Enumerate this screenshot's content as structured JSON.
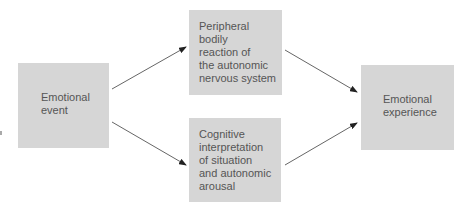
{
  "diagram": {
    "type": "flow",
    "nodes": [
      {
        "id": "event",
        "label": "Emotional event",
        "lines": [
          "Emotional",
          "event"
        ]
      },
      {
        "id": "physio",
        "label": "Peripheral bodily reaction of the autonomic nervous system",
        "lines": [
          "Peripheral",
          "bodily",
          "reaction of",
          "the autonomic",
          "nervous system"
        ]
      },
      {
        "id": "cognitive",
        "label": "Cognitive interpretation of situation and autonomic arousal",
        "lines": [
          "Cognitive",
          "interpretation",
          "of situation",
          "and autonomic",
          "arousal"
        ]
      },
      {
        "id": "experience",
        "label": "Emotional experience",
        "lines": [
          "Emotional",
          "experience"
        ]
      }
    ],
    "edges": [
      {
        "from": "event",
        "to": "physio"
      },
      {
        "from": "event",
        "to": "cognitive"
      },
      {
        "from": "physio",
        "to": "experience"
      },
      {
        "from": "cognitive",
        "to": "experience"
      }
    ],
    "colors": {
      "box_fill": "#d6d6d6",
      "text": "#555555",
      "arrow": "#555555"
    }
  }
}
